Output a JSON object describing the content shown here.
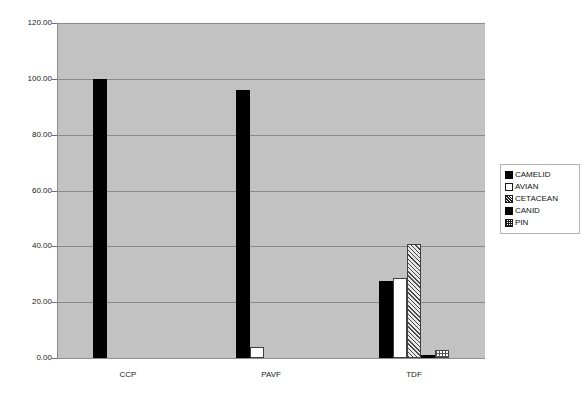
{
  "chart_data": {
    "type": "bar",
    "title": "",
    "subtitle": "",
    "xlabel": "",
    "ylabel": "",
    "categories": [
      "CCP",
      "PAVF",
      "TDF"
    ],
    "series": [
      {
        "name": "CAMELID",
        "pattern": "solid-black",
        "values": [
          100.0,
          96.0,
          27.5
        ]
      },
      {
        "name": "AVIAN",
        "pattern": "white",
        "values": [
          0.0,
          4.0,
          28.5
        ]
      },
      {
        "name": "CETACEAN",
        "pattern": "hatch",
        "values": [
          0.0,
          0.0,
          40.8
        ]
      },
      {
        "name": "CANID",
        "pattern": "solid-black",
        "values": [
          0.0,
          0.0,
          1.0
        ]
      },
      {
        "name": "PIN",
        "pattern": "dots",
        "values": [
          0.0,
          0.0,
          3.0
        ]
      }
    ],
    "ylim": [
      0,
      120
    ],
    "ytick_values": [
      0,
      20,
      40,
      60,
      80,
      100,
      120
    ],
    "ytick_labels": [
      "0.00",
      "20.00",
      "40.00",
      "60.00",
      "80.00",
      "100.00",
      "120.00"
    ],
    "grid": true,
    "legend_position": "right",
    "plot_background": "#c2c2c2",
    "page_background": "#ffffff",
    "gridline_color": "#8a8a8a",
    "bar_outline_color": "#404040"
  },
  "yaxis": {
    "ticks": [
      {
        "label": "120.00",
        "value": 120
      },
      {
        "label": "100.00",
        "value": 100
      },
      {
        "label": "80.00",
        "value": 80
      },
      {
        "label": "60.00",
        "value": 60
      },
      {
        "label": "40.00",
        "value": 40
      },
      {
        "label": "20.00",
        "value": 20
      },
      {
        "label": "0.00",
        "value": 0
      }
    ]
  },
  "xaxis": {
    "ticks": [
      {
        "label": "CCP"
      },
      {
        "label": "PAVF"
      },
      {
        "label": "TDF"
      }
    ]
  },
  "legend": {
    "items": [
      {
        "label": "CAMELID",
        "swatch": "solid-black-swatch"
      },
      {
        "label": "AVIAN",
        "swatch": "white-swatch"
      },
      {
        "label": "CETACEAN",
        "swatch": "hatch-swatch"
      },
      {
        "label": "CANID",
        "swatch": "solid-black-swatch"
      },
      {
        "label": "PIN",
        "swatch": "dots-swatch"
      }
    ]
  }
}
